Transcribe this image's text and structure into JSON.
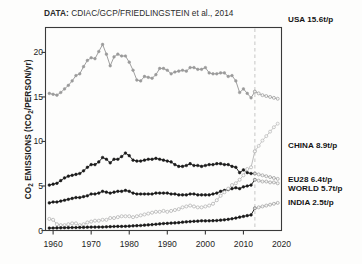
{
  "source": {
    "label": "DATA:",
    "text": " CDIAC/GCP/FRIEDLINGSTEIN et al., 2014"
  },
  "axes": {
    "ylabel_pre": "CO",
    "ylabel_sub1": "2",
    "ylabel_mid": " EMISSIONS (tCO",
    "ylabel_sub2": "2",
    "ylabel_post": "/PERSON/yr)",
    "yticks": [
      "0",
      "5",
      "10",
      "15",
      "20"
    ],
    "xticks": [
      "1960",
      "1970",
      "1980",
      "1990",
      "2000",
      "2010",
      "2020"
    ]
  },
  "labels": {
    "usa": "USA 15.6t/p",
    "china": "CHINA 8.9t/p",
    "eu28": "EU28 6.4t/p",
    "world": "WORLD 5.7t/p",
    "india": "INDIA 2.5t/p"
  },
  "colors": {
    "dark": "#1a1a1a",
    "light": "#b9b9b9",
    "frame": "#3a3a3a",
    "guide": "#cfcfcf",
    "background": "#fdfdfc"
  },
  "chart_data": {
    "type": "line",
    "title": "DATA: CDIAC/GCP/FRIEDLINGSTEIN et al., 2014",
    "xlabel": "",
    "ylabel": "CO2 EMISSIONS (tCO2/PERSON/yr)",
    "xlim": [
      1958,
      2020
    ],
    "ylim": [
      0,
      22.8
    ],
    "xticks": [
      1960,
      1970,
      1980,
      1990,
      2000,
      2010,
      2020
    ],
    "yticks": [
      0,
      5,
      10,
      15,
      20
    ],
    "grid": false,
    "legend": "right-inline-series-end-labels",
    "annotations": [
      {
        "type": "vline",
        "x": 2013,
        "style": "dashed",
        "color": "#cfcfcf"
      }
    ],
    "x": [
      1959,
      1960,
      1961,
      1962,
      1963,
      1964,
      1965,
      1966,
      1967,
      1968,
      1969,
      1970,
      1971,
      1972,
      1973,
      1974,
      1975,
      1976,
      1977,
      1978,
      1979,
      1980,
      1981,
      1982,
      1983,
      1984,
      1985,
      1986,
      1987,
      1988,
      1989,
      1990,
      1991,
      1992,
      1993,
      1994,
      1995,
      1996,
      1997,
      1998,
      1999,
      2000,
      2001,
      2002,
      2003,
      2004,
      2005,
      2006,
      2007,
      2008,
      2009,
      2010,
      2011,
      2012,
      2013
    ],
    "series": [
      {
        "name": "USA",
        "marker": "filled-circle",
        "color": "#9a9a9a",
        "end_value": 15.6,
        "end_label": "USA 15.6t/p",
        "values": [
          15.4,
          15.3,
          15.2,
          15.5,
          15.9,
          16.3,
          16.8,
          17.4,
          17.6,
          18.4,
          19.1,
          19.4,
          19.3,
          20.1,
          20.9,
          19.8,
          18.5,
          19.5,
          19.8,
          19.6,
          19.6,
          18.9,
          18.0,
          16.9,
          16.8,
          17.3,
          17.2,
          17.1,
          17.5,
          18.2,
          18.2,
          18.0,
          17.6,
          17.8,
          17.9,
          18.0,
          17.9,
          18.3,
          18.3,
          18.1,
          18.1,
          18.3,
          17.7,
          17.6,
          17.6,
          17.7,
          17.7,
          17.3,
          17.4,
          16.8,
          15.5,
          15.9,
          15.4,
          14.9,
          15.6
        ]
      },
      {
        "name": "EU28",
        "marker": "filled-circle",
        "color": "#1a1a1a",
        "end_value": 6.4,
        "end_label": "EU28 6.4t/p",
        "values": [
          5.1,
          5.2,
          5.3,
          5.6,
          5.9,
          6.1,
          6.2,
          6.3,
          6.4,
          6.7,
          7.1,
          7.4,
          7.4,
          7.7,
          8.2,
          8.0,
          7.6,
          8.0,
          8.0,
          8.3,
          8.7,
          8.4,
          7.9,
          7.8,
          7.8,
          7.9,
          8.0,
          8.0,
          8.1,
          8.0,
          7.9,
          7.8,
          7.7,
          7.4,
          7.2,
          7.2,
          7.3,
          7.5,
          7.3,
          7.3,
          7.2,
          7.3,
          7.4,
          7.4,
          7.5,
          7.5,
          7.4,
          7.4,
          7.2,
          7.1,
          6.5,
          6.8,
          6.5,
          6.4,
          6.4
        ]
      },
      {
        "name": "WORLD",
        "marker": "filled-circle",
        "color": "#1a1a1a",
        "end_value": 5.7,
        "end_label": "WORLD 5.7t/p",
        "values": [
          3.1,
          3.2,
          3.2,
          3.3,
          3.4,
          3.5,
          3.6,
          3.7,
          3.7,
          3.8,
          3.9,
          4.1,
          4.1,
          4.2,
          4.4,
          4.3,
          4.2,
          4.3,
          4.4,
          4.4,
          4.5,
          4.4,
          4.2,
          4.1,
          4.1,
          4.1,
          4.1,
          4.1,
          4.2,
          4.2,
          4.2,
          4.2,
          4.1,
          4.1,
          4.0,
          4.0,
          4.0,
          4.1,
          4.1,
          4.0,
          4.0,
          4.0,
          4.0,
          4.1,
          4.2,
          4.4,
          4.5,
          4.6,
          4.7,
          4.8,
          4.7,
          4.9,
          5.0,
          5.1,
          5.7
        ]
      },
      {
        "name": "CHINA",
        "marker": "open-circle",
        "color": "#b9b9b9",
        "end_value": 8.9,
        "end_label": "CHINA 8.9t/p",
        "values": [
          1.3,
          1.2,
          0.7,
          0.6,
          0.6,
          0.7,
          0.8,
          0.8,
          0.6,
          0.7,
          0.9,
          1.0,
          1.1,
          1.1,
          1.2,
          1.2,
          1.4,
          1.4,
          1.5,
          1.6,
          1.6,
          1.6,
          1.5,
          1.6,
          1.7,
          1.8,
          1.9,
          2.0,
          2.1,
          2.1,
          2.2,
          2.1,
          2.2,
          2.3,
          2.4,
          2.6,
          2.7,
          2.8,
          2.7,
          2.6,
          2.6,
          2.7,
          2.8,
          3.0,
          3.4,
          3.9,
          4.3,
          4.7,
          5.1,
          5.3,
          5.7,
          6.2,
          6.9,
          7.1,
          8.9
        ]
      },
      {
        "name": "INDIA",
        "marker": "filled-circle",
        "color": "#1a1a1a",
        "end_value": 2.5,
        "end_label": "INDIA 2.5t/p",
        "values": [
          0.27,
          0.28,
          0.29,
          0.3,
          0.31,
          0.32,
          0.33,
          0.33,
          0.34,
          0.35,
          0.37,
          0.38,
          0.38,
          0.39,
          0.39,
          0.41,
          0.43,
          0.45,
          0.46,
          0.46,
          0.47,
          0.49,
          0.52,
          0.54,
          0.56,
          0.6,
          0.63,
          0.66,
          0.7,
          0.74,
          0.78,
          0.8,
          0.83,
          0.85,
          0.88,
          0.93,
          0.97,
          1.0,
          1.03,
          1.05,
          1.09,
          1.08,
          1.09,
          1.1,
          1.12,
          1.16,
          1.2,
          1.25,
          1.32,
          1.4,
          1.5,
          1.58,
          1.67,
          1.75,
          2.5
        ]
      }
    ],
    "projection": {
      "note": "values after the 2013 dashed guide are drawn as faded open markers",
      "x": [
        2013,
        2014,
        2015,
        2016,
        2017,
        2018,
        2019
      ],
      "USA": [
        15.6,
        15.4,
        15.2,
        15.1,
        15.0,
        14.9,
        14.8
      ],
      "CHINA": [
        8.9,
        9.5,
        10.1,
        10.6,
        11.1,
        11.6,
        12.0
      ],
      "EU28": [
        6.4,
        6.3,
        6.2,
        6.1,
        6.0,
        5.9,
        5.8
      ],
      "WORLD": [
        5.7,
        5.6,
        5.5,
        5.5,
        5.4,
        5.4,
        5.3
      ],
      "INDIA": [
        2.5,
        2.6,
        2.7,
        2.8,
        2.9,
        3.0,
        3.1
      ]
    }
  }
}
